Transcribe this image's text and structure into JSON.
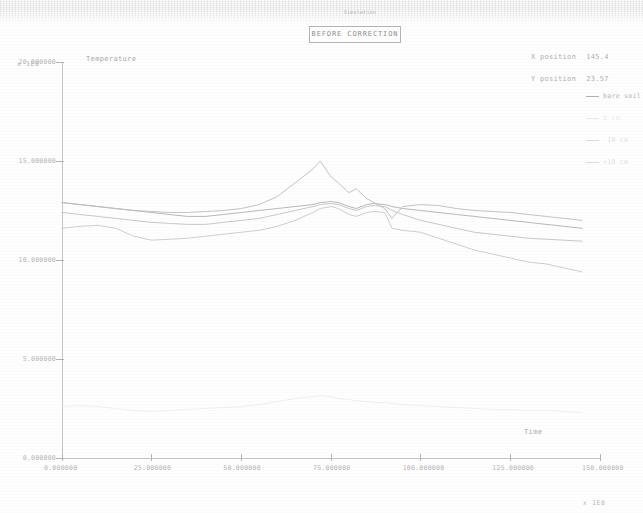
{
  "window": {
    "micro_caption": "Simulation",
    "title": "BEFORE CORRECTION"
  },
  "readouts": {
    "x_label": "X position",
    "x_value": "145.4",
    "y_label": "Y position",
    "y_value": "23.57"
  },
  "legend": {
    "items": [
      {
        "label": "bare soil",
        "color": "#b0b0b0",
        "strength": "normal"
      },
      {
        "label": "0 cm",
        "color": "#e8e8e8",
        "strength": "vfaint"
      },
      {
        "label": "-10 cm",
        "color": "#dcdcdc",
        "strength": "faint"
      },
      {
        "label": "+10 cm",
        "color": "#dcdcdc",
        "strength": "faint"
      }
    ]
  },
  "chart_data": {
    "type": "line",
    "title": "BEFORE CORRECTION",
    "xlabel": "Time",
    "ylabel": "Temperature",
    "x_exponent": "x 1E0",
    "y_exponent": "x 1E0",
    "xlim": [
      0,
      150
    ],
    "ylim": [
      0,
      20
    ],
    "grid": false,
    "legend_position": "right",
    "xticks": [
      0,
      25,
      50,
      75,
      100,
      125,
      150
    ],
    "xtick_labels": [
      "0.000000",
      "25.000000",
      "50.000000",
      "75.000000",
      "100.000000",
      "125.000000",
      "150.000000"
    ],
    "yticks": [
      0,
      5,
      10,
      15,
      20
    ],
    "ytick_labels": [
      "0.000000",
      "5.000000",
      "10.000000",
      "15.000000",
      "20.000000"
    ],
    "x": [
      0,
      5,
      10,
      15,
      20,
      25,
      30,
      35,
      40,
      45,
      50,
      55,
      60,
      65,
      70,
      72,
      75,
      77,
      80,
      82,
      85,
      87,
      90,
      92,
      95,
      100,
      105,
      110,
      115,
      120,
      125,
      130,
      135,
      140,
      145
    ],
    "series": [
      {
        "name": "bare soil",
        "color": "#b0b0b0",
        "values": [
          12.9,
          12.8,
          12.7,
          12.6,
          12.5,
          12.4,
          12.3,
          12.2,
          12.2,
          12.3,
          12.4,
          12.5,
          12.6,
          12.7,
          12.8,
          12.9,
          12.95,
          12.9,
          12.7,
          12.6,
          12.8,
          12.85,
          12.8,
          12.7,
          12.6,
          12.5,
          12.4,
          12.3,
          12.2,
          12.1,
          12.0,
          11.9,
          11.8,
          11.7,
          11.6
        ]
      },
      {
        "name": "+10 cm",
        "color": "#c2c2c2",
        "values": [
          12.4,
          12.3,
          12.2,
          12.1,
          12.0,
          11.9,
          11.85,
          11.8,
          11.8,
          11.9,
          12.0,
          12.1,
          12.3,
          12.5,
          12.7,
          12.8,
          12.85,
          12.8,
          12.6,
          12.5,
          12.7,
          12.75,
          12.7,
          12.5,
          12.3,
          12.0,
          11.8,
          11.6,
          11.4,
          11.3,
          11.2,
          11.1,
          11.05,
          11.0,
          10.95
        ]
      },
      {
        "name": "-10 cm",
        "color": "#c8c8c8",
        "values": [
          11.6,
          11.7,
          11.75,
          11.6,
          11.2,
          11.0,
          11.05,
          11.1,
          11.2,
          11.3,
          11.4,
          11.5,
          11.7,
          12.0,
          12.4,
          12.6,
          12.7,
          12.6,
          12.3,
          12.2,
          12.4,
          12.45,
          12.4,
          11.6,
          11.5,
          11.4,
          11.1,
          10.8,
          10.5,
          10.3,
          10.1,
          9.9,
          9.8,
          9.6,
          9.4
        ]
      },
      {
        "name": "peak trace",
        "color": "#bcbcbc",
        "values": [
          12.9,
          12.8,
          12.7,
          12.6,
          12.5,
          12.45,
          12.4,
          12.4,
          12.45,
          12.5,
          12.6,
          12.8,
          13.2,
          13.9,
          14.6,
          15.0,
          14.2,
          13.9,
          13.4,
          13.6,
          13.1,
          12.9,
          12.6,
          12.1,
          12.7,
          12.8,
          12.75,
          12.6,
          12.5,
          12.45,
          12.4,
          12.3,
          12.2,
          12.1,
          12.0
        ]
      },
      {
        "name": "lower faint trace",
        "color": "#ededed",
        "values": [
          2.6,
          2.65,
          2.6,
          2.5,
          2.4,
          2.35,
          2.4,
          2.45,
          2.5,
          2.55,
          2.6,
          2.7,
          2.85,
          3.0,
          3.1,
          3.15,
          3.1,
          3.0,
          2.95,
          2.9,
          2.85,
          2.8,
          2.8,
          2.75,
          2.7,
          2.65,
          2.6,
          2.55,
          2.5,
          2.45,
          2.45,
          2.4,
          2.4,
          2.35,
          2.3
        ]
      }
    ]
  }
}
